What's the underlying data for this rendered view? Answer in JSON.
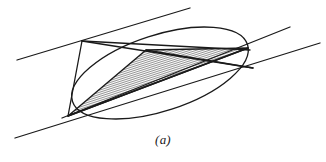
{
  "figure": {
    "caption": "(a)",
    "background_color": "#ffffff",
    "stroke_color": "#1a1a1a",
    "hatch_color": "#2b2b2b",
    "canvas": {
      "width": 326,
      "height": 162
    },
    "ellipse": {
      "label": "conic-ellipse",
      "center_x": 160,
      "center_y": 73,
      "radius_x": 92,
      "radius_y": 38,
      "rotation_deg": -18,
      "stroke_width": 1.3
    },
    "parallel_lines": [
      {
        "label": "tangent-line-upper",
        "x1": 17,
        "y1": 60,
        "x2": 190,
        "y2": 8,
        "stroke_width": 1.3
      },
      {
        "label": "tangent-line-middle",
        "x1": 62,
        "y1": 118,
        "x2": 290,
        "y2": 27,
        "stroke_width": 1.3
      },
      {
        "label": "tangent-line-lower",
        "x1": 15,
        "y1": 138,
        "x2": 320,
        "y2": 43,
        "stroke_width": 1.3
      }
    ],
    "triangle": {
      "label": "inscribed-hatched-triangle",
      "vertices": [
        {
          "name": "vertex-left",
          "x": 68,
          "y": 116
        },
        {
          "name": "vertex-top",
          "x": 146,
          "y": 50
        },
        {
          "name": "vertex-right",
          "x": 248,
          "y": 48
        }
      ],
      "fill": "hatch-diagonal",
      "hatch_angle_deg": 72,
      "hatch_spacing_px": 2,
      "stroke_width": 1.4
    },
    "chords": [
      {
        "label": "chord-upper-left-to-right",
        "x1": 82,
        "y1": 41,
        "x2": 250,
        "y2": 50,
        "stroke_width": 1.3
      },
      {
        "label": "chord-upper-left-to-lower-right",
        "x1": 82,
        "y1": 41,
        "x2": 253,
        "y2": 68,
        "stroke_width": 1.3
      },
      {
        "label": "chord-left-vertex-to-right-vertex",
        "x1": 68,
        "y1": 116,
        "x2": 248,
        "y2": 48,
        "stroke_width": 1.4
      },
      {
        "label": "chord-left-vertex-to-upper-left",
        "x1": 68,
        "y1": 116,
        "x2": 82,
        "y2": 41,
        "stroke_width": 1.3
      },
      {
        "label": "chord-lower-right-short",
        "x1": 146,
        "y1": 50,
        "x2": 253,
        "y2": 68,
        "stroke_width": 1.3
      }
    ]
  }
}
